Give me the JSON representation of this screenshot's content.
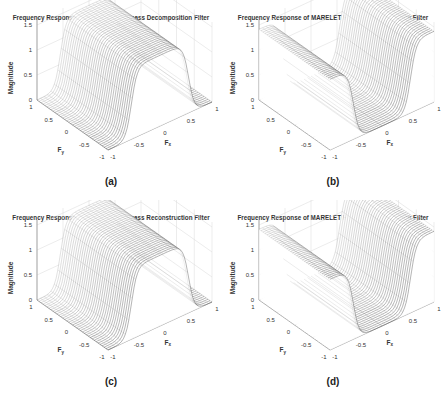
{
  "figure": {
    "panels": [
      {
        "id": "a",
        "title": "Frequency Response of MARELET Lowpass Decomposition Filter",
        "caption": "(a)",
        "kind": "lowpass"
      },
      {
        "id": "b",
        "title": "Frequency Response of MARELET Hipass Decomposition Filter",
        "caption": "(b)",
        "kind": "highpass"
      },
      {
        "id": "c",
        "title": "Frequency Response of MARELET Lowpass Reconstruction Filter",
        "caption": "(c)",
        "kind": "lowpass"
      },
      {
        "id": "d",
        "title": "Frequency Response of MARELET Hipass Reconstruction Filter",
        "caption": "(d)",
        "kind": "highpass"
      }
    ],
    "zlabel": "Magnitude",
    "xlabel": "Fx",
    "ylabel": "Fy",
    "ztick_labels": [
      "0",
      "0.5",
      "1",
      "1.5"
    ],
    "xtick_labels": [
      "-1",
      "-0.5",
      "0",
      "0.5",
      "1"
    ],
    "ytick_labels": [
      "1",
      "0.5",
      "0",
      "-0.5",
      "-1"
    ],
    "surface_color": "#555555"
  },
  "chart_data": [
    {
      "type": "surface",
      "title": "Frequency Response of MARELET Lowpass Decomposition Filter",
      "xlabel": "Fx",
      "ylabel": "Fy",
      "zlabel": "Magnitude",
      "xlim": [
        -1,
        1
      ],
      "ylim": [
        -1,
        1
      ],
      "zlim": [
        0,
        1.5
      ],
      "xticks": [
        -1,
        -0.5,
        0,
        0.5,
        1
      ],
      "yticks": [
        -1,
        -0.5,
        0,
        0.5,
        1
      ],
      "zticks": [
        0,
        0.5,
        1,
        1.5
      ],
      "description": "Magnitude ~1.41 for |Fx| < ~0.5, falling to 0 near |Fx| = 1; constant along Fy",
      "profile_x": [
        -1,
        -0.75,
        -0.5,
        -0.25,
        0,
        0.25,
        0.5,
        0.75,
        1
      ],
      "profile_z": [
        0,
        0.05,
        0.9,
        1.4,
        1.41,
        1.4,
        0.9,
        0.05,
        0
      ],
      "grid": true
    },
    {
      "type": "surface",
      "title": "Frequency Response of MARELET Hipass Decomposition Filter",
      "xlabel": "Fx",
      "ylabel": "Fy",
      "zlabel": "Magnitude",
      "xlim": [
        -1,
        1
      ],
      "ylim": [
        -1,
        1
      ],
      "zlim": [
        0,
        1.5
      ],
      "xticks": [
        -1,
        -0.5,
        0,
        0.5,
        1
      ],
      "yticks": [
        -1,
        -0.5,
        0,
        0.5,
        1
      ],
      "zticks": [
        0,
        0.5,
        1,
        1.5
      ],
      "description": "Magnitude ~0 near Fx = 0, rising to ~1.41 for |Fx| > ~0.5; constant along Fy",
      "profile_x": [
        -1,
        -0.75,
        -0.5,
        -0.25,
        0,
        0.25,
        0.5,
        0.75,
        1
      ],
      "profile_z": [
        1.41,
        1.4,
        1.0,
        0.15,
        0,
        0.15,
        1.0,
        1.4,
        1.41
      ],
      "grid": true
    },
    {
      "type": "surface",
      "title": "Frequency Response of MARELET Lowpass Reconstruction Filter",
      "xlabel": "Fx",
      "ylabel": "Fy",
      "zlabel": "Magnitude",
      "xlim": [
        -1,
        1
      ],
      "ylim": [
        -1,
        1
      ],
      "zlim": [
        0,
        1.5
      ],
      "xticks": [
        -1,
        -0.5,
        0,
        0.5,
        1
      ],
      "yticks": [
        -1,
        -0.5,
        0,
        0.5,
        1
      ],
      "zticks": [
        0,
        0.5,
        1,
        1.5
      ],
      "description": "Magnitude ~1.41 for |Fx| < ~0.5, falling to 0 near |Fx| = 1; constant along Fy",
      "profile_x": [
        -1,
        -0.75,
        -0.5,
        -0.25,
        0,
        0.25,
        0.5,
        0.75,
        1
      ],
      "profile_z": [
        0,
        0.05,
        0.9,
        1.4,
        1.41,
        1.4,
        0.9,
        0.05,
        0
      ],
      "grid": true
    },
    {
      "type": "surface",
      "title": "Frequency Response of MARELET Hipass Reconstruction Filter",
      "xlabel": "Fx",
      "ylabel": "Fy",
      "zlabel": "Magnitude",
      "xlim": [
        -1,
        1
      ],
      "ylim": [
        -1,
        1
      ],
      "zlim": [
        0,
        1.5
      ],
      "xticks": [
        -1,
        -0.5,
        0,
        0.5,
        1
      ],
      "yticks": [
        -1,
        -0.5,
        0,
        0.5,
        1
      ],
      "zticks": [
        0,
        0.5,
        1,
        1.5
      ],
      "description": "Magnitude ~0 near Fx = 0, rising to ~1.41 for |Fx| > ~0.5; constant along Fy",
      "profile_x": [
        -1,
        -0.75,
        -0.5,
        -0.25,
        0,
        0.25,
        0.5,
        0.75,
        1
      ],
      "profile_z": [
        1.41,
        1.4,
        1.0,
        0.15,
        0,
        0.15,
        1.0,
        1.4,
        1.41
      ],
      "grid": true
    }
  ]
}
